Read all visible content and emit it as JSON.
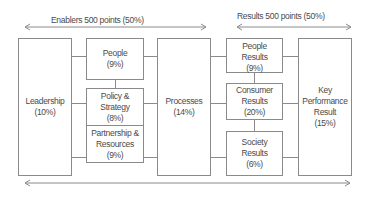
{
  "enablers": {
    "label": "Enablers 500 points (50%)",
    "boxes": {
      "leadership": {
        "name": "Leadership",
        "weight": "(10%)"
      },
      "people": {
        "name": "People",
        "weight": "(9%)"
      },
      "policy": {
        "name_line1": "Policy &",
        "name_line2": "Strategy",
        "weight": "(8%)"
      },
      "partnership": {
        "name_line1": "Partnership &",
        "name_line2": "Resources",
        "weight": "(9%)"
      },
      "processes": {
        "name": "Processes",
        "weight": "(14%)"
      }
    }
  },
  "results": {
    "label": "Results 500 points (50%)",
    "boxes": {
      "people_results": {
        "name_line1": "People",
        "name_line2": "Results",
        "weight": "(9%)"
      },
      "consumer_results": {
        "name_line1": "Consumer",
        "name_line2": "Results",
        "weight": "(20%)"
      },
      "society_results": {
        "name_line1": "Society",
        "name_line2": "Results",
        "weight": "(6%)"
      },
      "kpr": {
        "name_line1": "Key",
        "name_line2": "Performance",
        "name_line3": "Result",
        "weight": "(15%)"
      }
    }
  },
  "colors": {
    "line": "#8a8a8a",
    "text": "#4a4a4a"
  }
}
